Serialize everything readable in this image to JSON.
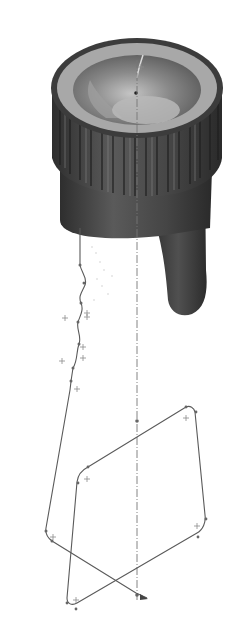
{
  "figure": {
    "colors": {
      "background": "#ffffff",
      "body_dark": "#3a3a3a",
      "body_mid": "#5e5e5e",
      "rim_light": "#9a9a9a",
      "bowl": "#7d7d7d",
      "bowl_light": "#b2b2b2",
      "sketch_line": "#555555",
      "centerline": "#777777",
      "point_mark": "#888888"
    },
    "knob": {
      "center_x": 136,
      "top_y": 88,
      "rim_rx": 86,
      "rim_ry": 48,
      "ridge_count": 16
    },
    "centerline": {
      "x": 137,
      "y1": 60,
      "y2": 600
    },
    "sweep_path": [
      [
        80,
        228
      ],
      [
        80,
        265
      ],
      [
        86,
        282
      ],
      [
        80,
        298
      ],
      [
        82,
        312
      ],
      [
        76,
        330
      ],
      [
        82,
        340
      ],
      [
        76,
        360
      ],
      [
        72,
        385
      ],
      [
        46,
        530
      ],
      [
        50,
        540
      ],
      [
        140,
        596
      ],
      [
        148,
        598
      ]
    ],
    "profile_loop": [
      [
        78,
        480
      ],
      [
        86,
        470
      ],
      [
        188,
        408
      ],
      [
        194,
        410
      ],
      [
        196,
        415
      ],
      [
        205,
        515
      ],
      [
        203,
        532
      ],
      [
        196,
        540
      ],
      [
        76,
        608
      ],
      [
        69,
        606
      ],
      [
        67,
        600
      ]
    ],
    "profile_corners": [
      [
        86,
        480
      ],
      [
        186,
        418
      ],
      [
        196,
        528
      ],
      [
        76,
        600
      ]
    ],
    "path_plus_marks": [
      [
        84,
        280
      ],
      [
        64,
        273
      ],
      [
        82,
        313
      ],
      [
        84,
        318
      ],
      [
        80,
        347
      ],
      [
        80,
        358
      ],
      [
        62,
        361
      ],
      [
        76,
        389
      ]
    ],
    "centerline_points": [
      [
        137,
        421
      ],
      [
        137,
        595
      ]
    ]
  }
}
